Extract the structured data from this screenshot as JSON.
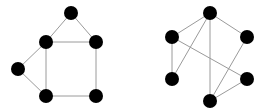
{
  "diagram": {
    "type": "graph-pair",
    "style": {
      "node_color": "#000000",
      "edge_color": "#9a9a9a",
      "node_radius": 7,
      "background": "#ffffff"
    },
    "graphs": [
      {
        "name": "left-graph",
        "nodes": [
          {
            "id": "a",
            "x": 71,
            "y": 13
          },
          {
            "id": "b",
            "x": 46,
            "y": 42
          },
          {
            "id": "c",
            "x": 96,
            "y": 42
          },
          {
            "id": "d",
            "x": 18,
            "y": 69
          },
          {
            "id": "e",
            "x": 46,
            "y": 96
          },
          {
            "id": "f",
            "x": 96,
            "y": 96
          }
        ],
        "edges": [
          [
            "a",
            "b"
          ],
          [
            "a",
            "c"
          ],
          [
            "b",
            "c"
          ],
          [
            "b",
            "d"
          ],
          [
            "d",
            "e"
          ],
          [
            "b",
            "e"
          ],
          [
            "c",
            "f"
          ],
          [
            "e",
            "f"
          ]
        ]
      },
      {
        "name": "right-graph",
        "nodes": [
          {
            "id": "a",
            "x": 210,
            "y": 13
          },
          {
            "id": "b",
            "x": 172,
            "y": 37
          },
          {
            "id": "c",
            "x": 247,
            "y": 37
          },
          {
            "id": "d",
            "x": 172,
            "y": 79
          },
          {
            "id": "e",
            "x": 247,
            "y": 79
          },
          {
            "id": "f",
            "x": 210,
            "y": 101
          }
        ],
        "edges": [
          [
            "a",
            "b"
          ],
          [
            "a",
            "c"
          ],
          [
            "a",
            "d"
          ],
          [
            "a",
            "f"
          ],
          [
            "b",
            "d"
          ],
          [
            "b",
            "e"
          ],
          [
            "c",
            "f"
          ],
          [
            "e",
            "f"
          ]
        ]
      }
    ]
  }
}
